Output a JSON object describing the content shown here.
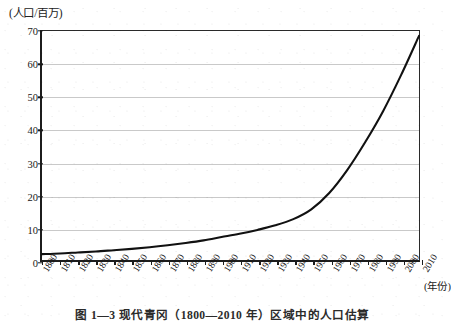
{
  "chart_data": {
    "type": "line",
    "title": "",
    "caption": "图 1—3  现代青冈（1800—2010 年）区域中的人口估算",
    "ylabel": "(人口/百万)",
    "xlabel": "(年份)",
    "ylim": [
      0,
      70
    ],
    "yticks": [
      0,
      10,
      20,
      30,
      40,
      50,
      60,
      70
    ],
    "xlim": [
      1800,
      2010
    ],
    "grid": true,
    "legend": "none",
    "categories": [
      "1800",
      "1810",
      "1820",
      "1830",
      "1840",
      "1850",
      "1860",
      "1870",
      "1880",
      "1890",
      "1900",
      "1910",
      "1920",
      "1930",
      "1940",
      "1950",
      "1960",
      "1970",
      "1980",
      "1990",
      "2000",
      "2010"
    ],
    "series": [
      {
        "name": "人口",
        "values": [
          1.8,
          2.0,
          2.3,
          2.6,
          3.0,
          3.4,
          3.9,
          4.5,
          5.2,
          6.0,
          7.0,
          8.0,
          9.2,
          10.6,
          12.5,
          15.5,
          20.5,
          27.5,
          36.0,
          45.5,
          56.5,
          68.5
        ]
      }
    ]
  },
  "axis": {
    "y_unit_label": "(人口/百万)",
    "x_unit_label": "(年份)"
  }
}
